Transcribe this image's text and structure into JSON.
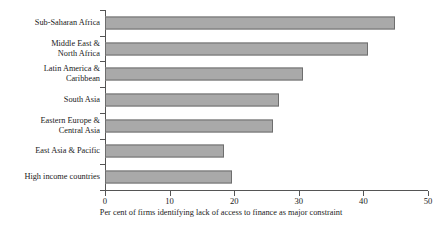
{
  "chart_data": {
    "type": "bar",
    "orientation": "horizontal",
    "title": "",
    "xlabel": "Per cent of firms identifying lack of access to finance as major constraint",
    "ylabel": "",
    "categories": [
      "Sub-Saharan Africa",
      "Middle East &\nNorth Africa",
      "Latin America &\nCaribbean",
      "South Asia",
      "Eastern Europe &\nCentral Asia",
      "East Asia & Pacific",
      "High income countries"
    ],
    "values": [
      44.9,
      40.7,
      30.7,
      26.9,
      26.0,
      18.4,
      19.6
    ],
    "xlim": [
      0,
      50
    ],
    "xticks": [
      0,
      10,
      20,
      30,
      40,
      50
    ],
    "xtick_labels": [
      "0",
      "10",
      "20",
      "30",
      "40",
      "50"
    ],
    "grid": false,
    "legend": false,
    "bar_color": "#a9a9a9",
    "bar_edge_color": "#6e6e6e",
    "axis_color": "#555555"
  }
}
